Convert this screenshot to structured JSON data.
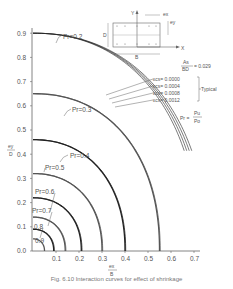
{
  "chart_data": {
    "type": "line",
    "title": "",
    "xlabel": "e_x / B",
    "ylabel": "e_y / D",
    "xlim": [
      0,
      0.7
    ],
    "ylim": [
      0,
      0.9
    ],
    "x_ticks": [
      "0.1",
      "0.2",
      "0.3",
      "0.4",
      "0.5",
      "0.6",
      "0.7"
    ],
    "y_ticks": [
      "0.0",
      "0.1",
      "0.2",
      "0.3",
      "0.4",
      "0.5",
      "0.6",
      "0.7",
      "0.8",
      "0.9"
    ],
    "grid": false,
    "series": [
      {
        "name": "P_r = 0.2",
        "label": "Pₑ = 0.2",
        "y_intercept": 0.9,
        "x_intercept": 0.72,
        "strands": 4
      },
      {
        "name": "P_r = 0.3",
        "y_intercept": 0.65,
        "x_intercept": 0.55,
        "strands": 2
      },
      {
        "name": "P_r = 0.4",
        "y_intercept": 0.46,
        "x_intercept": 0.4,
        "strands": 2
      },
      {
        "name": "P_r = 0.5",
        "y_intercept": 0.32,
        "x_intercept": 0.3,
        "strands": 2
      },
      {
        "name": "P_r = 0.6",
        "y_intercept": 0.22,
        "x_intercept": 0.21,
        "strands": 2
      },
      {
        "name": "P_r = 0.7",
        "y_intercept": 0.14,
        "x_intercept": 0.14,
        "strands": 2
      },
      {
        "name": "P_r = 0.8",
        "y_intercept": 0.09,
        "x_intercept": 0.09,
        "strands": 2
      },
      {
        "name": "P_r = 0.9",
        "y_intercept": 0.05,
        "x_intercept": 0.05,
        "strands": 1
      }
    ],
    "annotations": [
      "εcs = 0.00000",
      "εcs = 0.0004",
      "εcs = 0.0008",
      "εcs = 0.0012",
      "Typical",
      "As / BD = 0.029",
      "Pr = Pu / Po"
    ]
  },
  "labels": {
    "pr02": "Pr=0.2",
    "pr03": "Pr=0.3",
    "pr04": "Pr=0.4",
    "pr05": "Pr=0.5",
    "pr06": "Pr=0.6",
    "pr07": "Pr=0.7",
    "pr08": "0.8",
    "pr09": "0.9",
    "ecs0": "εcs= 0.0000",
    "ecs1": "εcs= 0.0004",
    "ecs2": "εcs= 0.0008",
    "ecs3": "εcs= 0.0012",
    "typical": "Typical",
    "ratio": "= 0.029",
    "as": "As",
    "bd": "BD",
    "pr_def_left": "Pr =",
    "pu": "Pu",
    "po": "Po",
    "inset_y": "Y",
    "inset_x": "X",
    "inset_d": "D",
    "inset_b": "B",
    "inset_ex": "ex",
    "inset_ey": "ey",
    "yaxis_num": "ey",
    "yaxis_den": "D",
    "xaxis_num": "ex",
    "xaxis_den": "B"
  },
  "axis": {
    "x_ticks": [
      "0.1",
      "0.2",
      "0.3",
      "0.4",
      "0.5",
      "0.6",
      "0.7"
    ],
    "y_ticks": [
      "0.0",
      "0.1",
      "0.2",
      "0.3",
      "0.4",
      "0.5",
      "0.6",
      "0.7",
      "0.8",
      "0.9"
    ]
  },
  "caption": "Fig. 6.10 Interaction curves for effect of shrinkage"
}
